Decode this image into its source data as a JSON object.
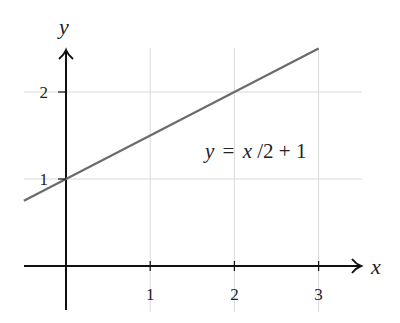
{
  "chart_data": {
    "type": "line",
    "title": "",
    "xlabel": "x",
    "ylabel": "y",
    "annotation": "y = x/2 + 1",
    "annotation_parts": {
      "lhs": "y",
      "eq": "=",
      "rhs_var": "x",
      "rhs_rest": "/2 + 1"
    },
    "xlim": [
      -0.5,
      3.5
    ],
    "ylim": [
      -0.3,
      2.5
    ],
    "x_ticks": [
      1,
      2,
      3
    ],
    "y_ticks": [
      1,
      2
    ],
    "x_tick_labels": [
      "1",
      "2",
      "3"
    ],
    "y_tick_labels": [
      "1",
      "2"
    ],
    "grid": true,
    "series": [
      {
        "name": "y = x/2 + 1",
        "x": [
          -0.5,
          3
        ],
        "y": [
          0.75,
          2.5
        ],
        "color": "#6b6b6b"
      }
    ]
  },
  "colors": {
    "axis": "#111111",
    "grid": "#d9d9d9",
    "line": "#6b6b6b"
  }
}
